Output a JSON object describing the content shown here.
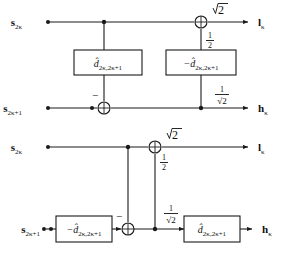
{
  "figure": {
    "type": "signal-flow-diagram",
    "diagrams": [
      {
        "id": "diagram-analysis",
        "inputs": [
          {
            "name": "input-s-2k",
            "base": "s",
            "subscript": "2κ",
            "row": "top"
          },
          {
            "name": "input-s-2k-plus-1",
            "base": "s",
            "subscript": "2κ+1",
            "row": "bottom"
          }
        ],
        "outputs": [
          {
            "name": "output-l-k",
            "base": "l",
            "subscript": "κ",
            "row": "top"
          },
          {
            "name": "output-h-k",
            "base": "h",
            "subscript": "κ",
            "row": "bottom"
          }
        ],
        "blocks": [
          {
            "name": "block-d-hat",
            "sign": "",
            "base": "d̂",
            "subscript": "2κ,2κ+1"
          },
          {
            "name": "block-neg-d-hat",
            "sign": "−",
            "base": "d̂",
            "subscript": "2κ,2κ+1"
          }
        ],
        "gains": [
          {
            "name": "gain-sqrt2-top",
            "numerator": "",
            "radicand": "2",
            "style": "sqrt"
          },
          {
            "name": "gain-one-half",
            "numerator": "1",
            "denominator": "2",
            "style": "fraction"
          },
          {
            "name": "gain-one-over-sqrt2",
            "numerator": "1",
            "denominator": "√2",
            "style": "fraction-sqrt"
          }
        ],
        "signs": [
          {
            "name": "minus-sign-lower-adder",
            "symbol": "−"
          }
        ],
        "adders": [
          {
            "name": "adder-top",
            "symbol": "⊕"
          },
          {
            "name": "adder-bottom",
            "symbol": "⊕"
          }
        ]
      },
      {
        "id": "diagram-synthesis",
        "inputs": [
          {
            "name": "input-s-2k",
            "base": "s",
            "subscript": "2κ",
            "row": "top"
          },
          {
            "name": "input-s-2k-plus-1",
            "base": "s",
            "subscript": "2κ+1",
            "row": "bottom"
          }
        ],
        "outputs": [
          {
            "name": "output-l-k",
            "base": "l",
            "subscript": "κ",
            "row": "top"
          },
          {
            "name": "output-h-k",
            "base": "h",
            "subscript": "κ",
            "row": "bottom"
          }
        ],
        "blocks": [
          {
            "name": "block-neg-d-hat",
            "sign": "−",
            "base": "d̂",
            "subscript": "2κ,2κ+1"
          },
          {
            "name": "block-d-hat",
            "sign": "",
            "base": "d̂",
            "subscript": "2κ,2κ+1"
          }
        ],
        "gains": [
          {
            "name": "gain-sqrt2-top",
            "numerator": "",
            "radicand": "2",
            "style": "sqrt"
          },
          {
            "name": "gain-one-half",
            "numerator": "1",
            "denominator": "2",
            "style": "fraction"
          },
          {
            "name": "gain-one-over-sqrt2",
            "numerator": "1",
            "denominator": "√2",
            "style": "fraction-sqrt"
          }
        ],
        "signs": [
          {
            "name": "minus-sign-lower-adder",
            "symbol": "−"
          }
        ],
        "adders": [
          {
            "name": "adder-top",
            "symbol": "⊕"
          },
          {
            "name": "adder-bottom",
            "symbol": "⊕"
          }
        ]
      }
    ],
    "colors": {
      "line": "#1a1a1a",
      "text": "#111111",
      "background": "#ffffff",
      "box_fill": "#ffffff"
    }
  }
}
